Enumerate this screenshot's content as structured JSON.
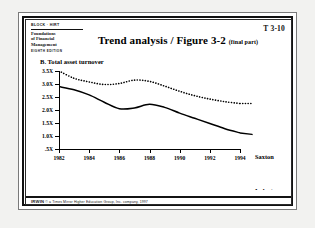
{
  "header": {
    "logo": {
      "brand": "BLOCK · HIRT",
      "title_line1": "Foundations",
      "title_line2": "of Financial",
      "title_line3": "Management",
      "edition": "EIGHTH EDITION"
    },
    "doc_code": "T 3-10",
    "title": "Trend analysis / Figure 3-2 ",
    "title_suffix": "(final part)"
  },
  "chart_panel": {
    "panel_label": "B.  Total asset turnover",
    "legend": {
      "saxton": "Saxton",
      "industry": "Industry"
    }
  },
  "footer": {
    "mark": "IRWIN",
    "copyright": "© a Times Mirror Higher Education Group, Inc. company, 1997"
  },
  "colors": {
    "line": "#000000",
    "paper": "#ffffff",
    "frame": "#111111",
    "page_bg": "#f2f2f0"
  },
  "chart_data": {
    "type": "line",
    "title": "B.  Total asset turnover",
    "xlabel": "",
    "ylabel": "",
    "grid": false,
    "legend_position": "right",
    "xlim": [
      1982,
      1994
    ],
    "ylim": [
      0.5,
      3.5
    ],
    "yticks": [
      3.5,
      3.0,
      2.5,
      2.0,
      1.5,
      1.0,
      0.5
    ],
    "ytick_labels": [
      "3.5X",
      "3.0X",
      "2.5X",
      "2.0X",
      "1.5X",
      "1.0X",
      ".5X"
    ],
    "xticks": [
      1982,
      1984,
      1986,
      1988,
      1990,
      1992,
      1994
    ],
    "xtick_labels": [
      "1982",
      "1984",
      "1986",
      "1988",
      "1990",
      "1992",
      "1994"
    ],
    "x": [
      1982,
      1983,
      1984,
      1985,
      1986,
      1987,
      1988,
      1989,
      1990,
      1991,
      1992,
      1993,
      1994
    ],
    "series": [
      {
        "name": "Saxton",
        "style": "dotted",
        "values": [
          3.5,
          3.22,
          3.08,
          2.98,
          3.02,
          3.15,
          3.1,
          2.92,
          2.72,
          2.55,
          2.42,
          2.32,
          2.25
        ]
      },
      {
        "name": "Industry",
        "style": "solid",
        "values": [
          2.9,
          2.78,
          2.58,
          2.3,
          2.05,
          2.08,
          2.22,
          2.1,
          1.88,
          1.68,
          1.48,
          1.28,
          1.12
        ]
      }
    ]
  }
}
